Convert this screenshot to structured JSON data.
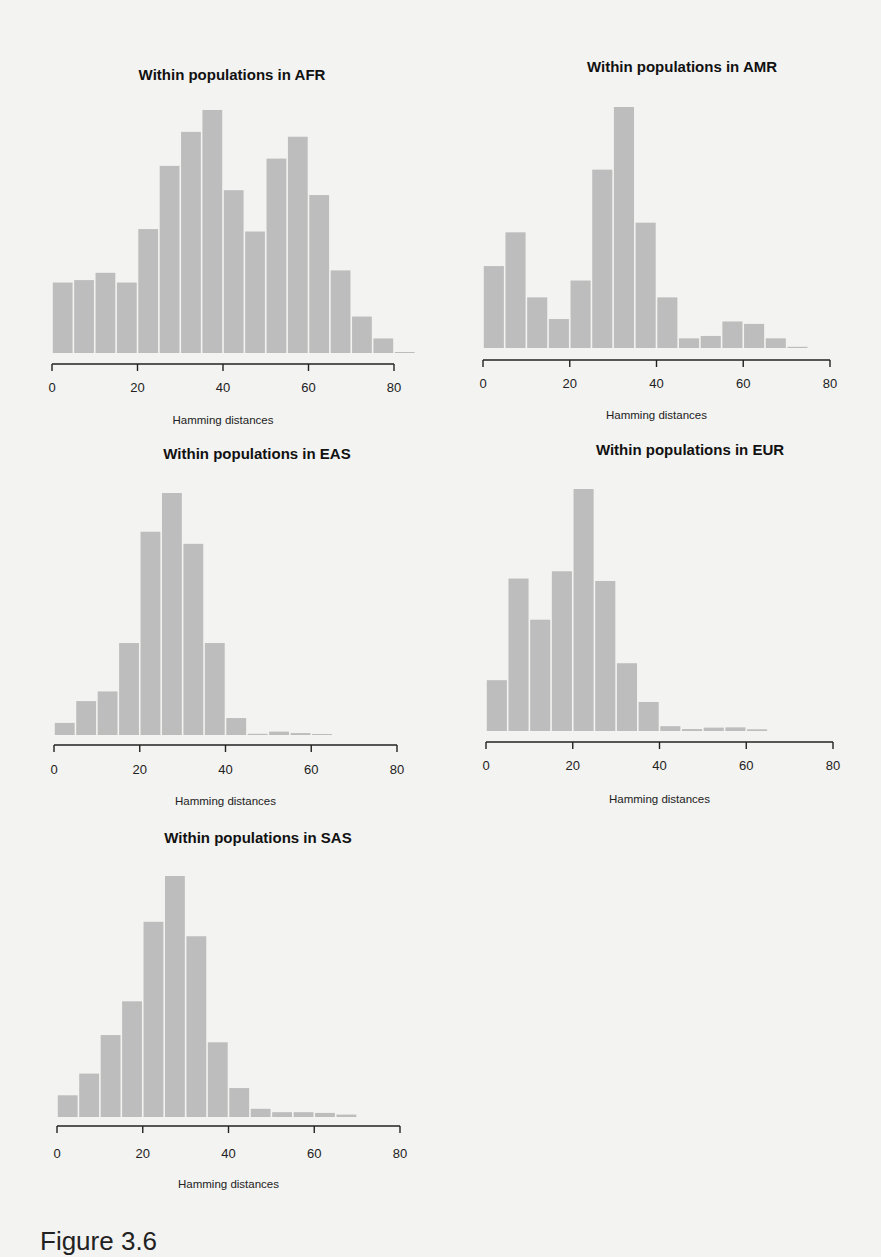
{
  "page": {
    "caption": "Figure 3.6"
  },
  "chart_data": [
    {
      "type": "bar",
      "title": "Within populations in AFR",
      "xlabel": "Hamming distances",
      "ylabel": "",
      "xlim": [
        0,
        80
      ],
      "xticks": [
        0,
        20,
        40,
        60,
        80
      ],
      "bin_width": 5,
      "bin_starts": [
        0,
        5,
        10,
        15,
        20,
        25,
        30,
        35,
        40,
        45,
        50,
        55,
        60,
        65,
        70,
        75,
        80
      ],
      "values_relative": [
        29,
        30,
        33,
        29,
        51,
        77,
        91,
        100,
        67,
        50,
        80,
        89,
        65,
        34,
        15,
        6,
        0.4
      ],
      "grid": false,
      "bar_color": "#bdbdbd"
    },
    {
      "type": "bar",
      "title": "Within populations in AMR",
      "xlabel": "Hamming distances",
      "ylabel": "",
      "xlim": [
        0,
        80
      ],
      "xticks": [
        0,
        20,
        40,
        60,
        80
      ],
      "bin_width": 5,
      "bin_starts": [
        0,
        5,
        10,
        15,
        20,
        25,
        30,
        35,
        40,
        45,
        50,
        55,
        60,
        65,
        70
      ],
      "values_relative": [
        34,
        48,
        21,
        12,
        28,
        74,
        100,
        52,
        21,
        4,
        5,
        11,
        10,
        4,
        0.5
      ],
      "grid": false,
      "bar_color": "#bdbdbd"
    },
    {
      "type": "bar",
      "title": "Within populations in EAS",
      "xlabel": "Hamming distances",
      "ylabel": "",
      "xlim": [
        0,
        80
      ],
      "xticks": [
        0,
        20,
        40,
        60,
        80
      ],
      "bin_width": 5,
      "bin_starts": [
        0,
        5,
        10,
        15,
        20,
        25,
        30,
        35,
        40,
        45,
        50,
        55,
        60
      ],
      "values_relative": [
        5,
        14,
        18,
        38,
        84,
        100,
        79,
        38,
        7,
        0.5,
        1.4,
        0.8,
        0.3
      ],
      "grid": false,
      "bar_color": "#bdbdbd"
    },
    {
      "type": "bar",
      "title": "Within populations in EUR",
      "xlabel": "Hamming distances",
      "ylabel": "",
      "xlim": [
        0,
        80
      ],
      "xticks": [
        0,
        20,
        40,
        60,
        80
      ],
      "bin_width": 5,
      "bin_starts": [
        0,
        5,
        10,
        15,
        20,
        25,
        30,
        35,
        40,
        45,
        50,
        55,
        60
      ],
      "values_relative": [
        21,
        63,
        46,
        66,
        100,
        62,
        28,
        12,
        2,
        0.8,
        1.4,
        1.5,
        0.7
      ],
      "grid": false,
      "bar_color": "#bdbdbd"
    },
    {
      "type": "bar",
      "title": "Within populations in SAS",
      "xlabel": "Hamming distances",
      "ylabel": "",
      "xlim": [
        0,
        80
      ],
      "xticks": [
        0,
        20,
        40,
        60,
        80
      ],
      "bin_width": 5,
      "bin_starts": [
        0,
        5,
        10,
        15,
        20,
        25,
        30,
        35,
        40,
        45,
        50,
        55,
        60,
        65
      ],
      "values_relative": [
        9,
        18,
        34,
        48,
        81,
        100,
        75,
        31,
        12,
        3.4,
        2,
        2,
        1.7,
        1
      ],
      "grid": false,
      "bar_color": "#bdbdbd"
    }
  ],
  "layout": {
    "panels": [
      {
        "title_x": 232,
        "title_y": 66,
        "x0": 52,
        "x80": 394,
        "baseline": 353,
        "top": 110,
        "axis_y": 364,
        "labels_y": 380,
        "xlabel_y": 414
      },
      {
        "title_x": 682,
        "title_y": 58,
        "x0": 483,
        "x80": 830,
        "baseline": 348,
        "top": 107,
        "axis_y": 360,
        "labels_y": 376,
        "xlabel_y": 409
      },
      {
        "title_x": 257,
        "title_y": 445,
        "x0": 54,
        "x80": 397,
        "baseline": 735,
        "top": 493,
        "axis_y": 745,
        "labels_y": 762,
        "xlabel_y": 795
      },
      {
        "title_x": 690,
        "title_y": 441,
        "x0": 486,
        "x80": 833,
        "baseline": 731,
        "top": 489,
        "axis_y": 742,
        "labels_y": 758,
        "xlabel_y": 793
      },
      {
        "title_x": 258,
        "title_y": 829,
        "x0": 57,
        "x80": 400,
        "baseline": 1117,
        "top": 876,
        "axis_y": 1126,
        "labels_y": 1146,
        "xlabel_y": 1178
      }
    ]
  }
}
